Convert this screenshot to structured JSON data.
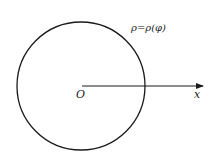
{
  "diagram": {
    "curve_label": "ρ=ρ(φ)",
    "origin_label": "O",
    "axis_label": "x",
    "stroke_color": "#1a1a1a",
    "background": "#ffffff",
    "circle": {
      "cx": 81,
      "cy": 86,
      "r": 64
    },
    "axis": {
      "x1": 82,
      "y1": 86,
      "x2": 203,
      "y2": 86
    }
  }
}
